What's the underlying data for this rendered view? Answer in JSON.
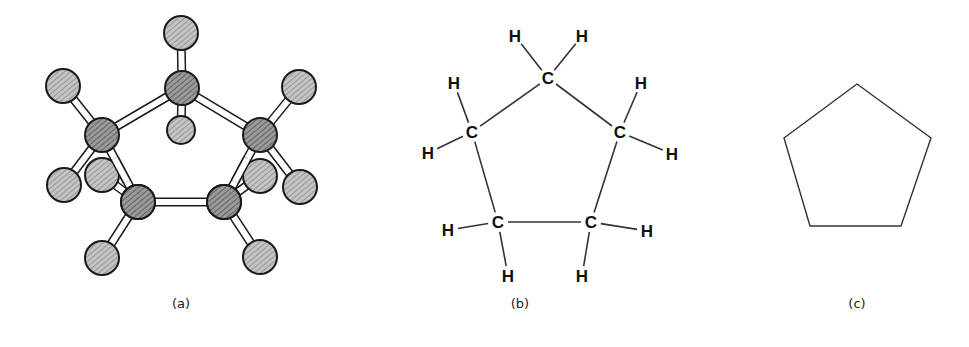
{
  "figure": {
    "panels": [
      {
        "id": "a",
        "label": "(a)",
        "kind": "ball-and-stick model",
        "carbons": [
          [
            182,
            88
          ],
          [
            102,
            135
          ],
          [
            260,
            135
          ],
          [
            138,
            202
          ],
          [
            224,
            202
          ]
        ],
        "hydrogens": [
          {
            "pos": [
              181,
              33
            ],
            "bond_to": 0
          },
          {
            "pos": [
              181,
              130
            ],
            "bond_to": 0
          },
          {
            "pos": [
              63,
              86
            ],
            "bond_to": 1
          },
          {
            "pos": [
              64,
              185
            ],
            "bond_to": 1
          },
          {
            "pos": [
              299,
              87
            ],
            "bond_to": 2
          },
          {
            "pos": [
              300,
              187
            ],
            "bond_to": 2
          },
          {
            "pos": [
              102,
              175
            ],
            "bond_to": 3
          },
          {
            "pos": [
              102,
              258
            ],
            "bond_to": 3
          },
          {
            "pos": [
              260,
              176
            ],
            "bond_to": 4
          },
          {
            "pos": [
              260,
              257
            ],
            "bond_to": 4
          }
        ],
        "ring_bonds": [
          [
            0,
            1
          ],
          [
            0,
            2
          ],
          [
            1,
            3
          ],
          [
            2,
            4
          ],
          [
            3,
            4
          ]
        ],
        "label_pos": [
          181,
          308
        ]
      },
      {
        "id": "b",
        "label": "(b)",
        "kind": "structural formula",
        "carbon_symbol": "C",
        "hydrogen_symbol": "H",
        "carbons": [
          [
            548,
            78
          ],
          [
            472,
            132
          ],
          [
            620,
            132
          ],
          [
            498,
            222
          ],
          [
            591,
            222
          ]
        ],
        "hydrogens": [
          {
            "pos": [
              515,
              36
            ],
            "bond_to": 0
          },
          {
            "pos": [
              582,
              36
            ],
            "bond_to": 0
          },
          {
            "pos": [
              454,
              83
            ],
            "bond_to": 1
          },
          {
            "pos": [
              428,
              153
            ],
            "bond_to": 1
          },
          {
            "pos": [
              641,
              83
            ],
            "bond_to": 2
          },
          {
            "pos": [
              672,
              154
            ],
            "bond_to": 2
          },
          {
            "pos": [
              448,
              230
            ],
            "bond_to": 3
          },
          {
            "pos": [
              508,
              276
            ],
            "bond_to": 3
          },
          {
            "pos": [
              647,
              231
            ],
            "bond_to": 4
          },
          {
            "pos": [
              582,
              276
            ],
            "bond_to": 4
          }
        ],
        "ring_bonds": [
          [
            0,
            1
          ],
          [
            0,
            2
          ],
          [
            1,
            3
          ],
          [
            2,
            4
          ],
          [
            3,
            4
          ]
        ],
        "label_pos": [
          520,
          308
        ]
      },
      {
        "id": "c",
        "label": "(c)",
        "kind": "skeletal (line) formula",
        "vertices": [
          [
            857,
            84
          ],
          [
            931,
            138
          ],
          [
            901,
            226
          ],
          [
            810,
            226
          ],
          [
            784,
            138
          ]
        ],
        "label_pos": [
          857,
          308
        ]
      }
    ],
    "colors": {
      "line": "#333333",
      "ball_fill": "#b8b8b8",
      "carbon_fill": "#8e8e8e",
      "ball_stroke": "#1a1a1a",
      "stick_fill": "#ffffff"
    }
  }
}
